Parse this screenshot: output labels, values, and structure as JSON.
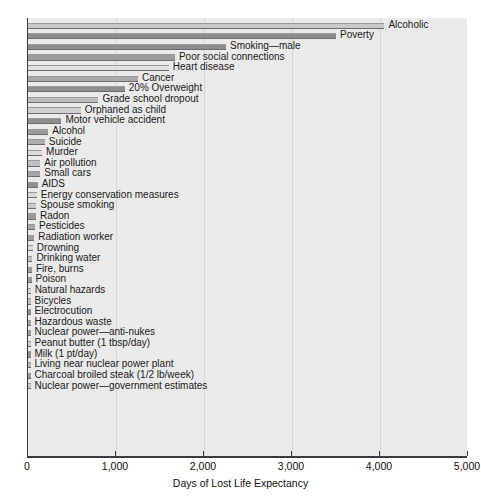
{
  "chart_data": {
    "type": "bar",
    "orientation": "horizontal",
    "title": "",
    "xlabel": "Days of Lost Life Expectancy",
    "ylabel": "",
    "xlim": [
      0,
      5000
    ],
    "xticks": [
      0,
      1000,
      2000,
      3000,
      4000,
      5000
    ],
    "xtick_labels": [
      "0",
      "1,000",
      "2,000",
      "3,000",
      "4,000",
      "5,000"
    ],
    "grid": true,
    "grid_axis": "x",
    "legend": "none",
    "plot_background": "#eaeaea",
    "categories": [
      "Alcoholic",
      "Poverty",
      "Smoking—male",
      "Poor social connections",
      "Heart disease",
      "Cancer",
      "20% Overweight",
      "Grade school dropout",
      "Orphaned as child",
      "Motor vehicle accident",
      "Alcohol",
      "Suicide",
      "Murder",
      "Air pollution",
      "Small cars",
      "AIDS",
      "Energy conservation measures",
      "Spouse smoking",
      "Radon",
      "Pesticides",
      "Radiation worker",
      "Drowning",
      "Drinking water",
      "Fire, burns",
      "Poison",
      "Natural hazards",
      "Bicycles",
      "Electrocution",
      "Hazardous waste",
      "Nuclear power—anti-nukes",
      "Peanut butter (1 tbsp/day)",
      "Milk (1 pt/day)",
      "Living near nuclear power plant",
      "Charcoal broiled steak (1/2 lb/week)",
      "Nuclear power—government estimates"
    ],
    "values": [
      4050,
      3500,
      2250,
      1670,
      1600,
      1250,
      1100,
      800,
      600,
      380,
      230,
      190,
      160,
      140,
      140,
      110,
      100,
      95,
      90,
      80,
      70,
      55,
      50,
      45,
      40,
      30,
      25,
      20,
      15,
      12,
      8,
      7,
      6,
      5,
      2
    ],
    "bar_shades": [
      "#c9c9c9",
      "#8d8d8d",
      "#8d8d8d",
      "#9b9b9b",
      "#e2e2e2",
      "#a9a9a9",
      "#8f8f8f",
      "#bcbcbc",
      "#cfcfcf",
      "#8d8d8d",
      "#9c9c9c",
      "#aeaeae",
      "#dcdcdc",
      "#c0c0c0",
      "#a5a5a5",
      "#8f8f8f",
      "#d8d8d8",
      "#cacaca",
      "#9a9a9a",
      "#a5a5a5",
      "#9d9d9d",
      "#dcdcdc",
      "#bdbdbd",
      "#9c9c9c",
      "#9a9a9a",
      "#d6d6d6",
      "#bfbfbf",
      "#8f8f8f",
      "#a3a3a3",
      "#9a9a9a",
      "#cbcbcb",
      "#8f8f8f",
      "#b5b5b5",
      "#9a9a9a",
      "#c6c6c6"
    ]
  }
}
